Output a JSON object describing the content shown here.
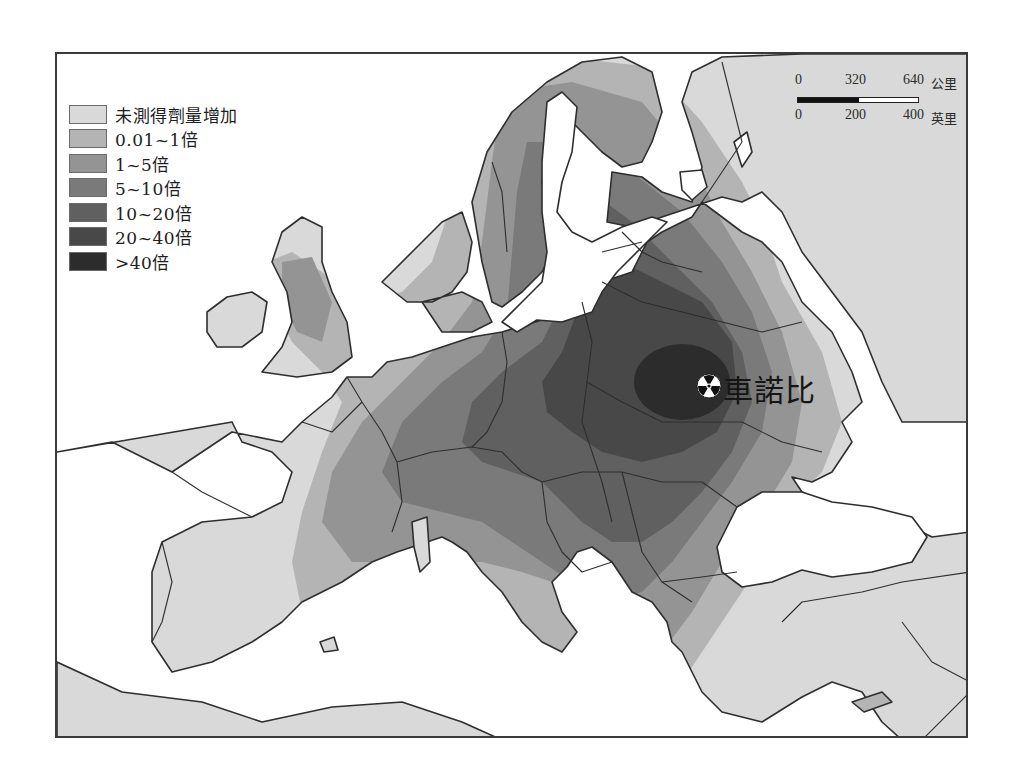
{
  "map": {
    "title_region": "Europe",
    "legend": {
      "items": [
        {
          "label": "未測得劑量增加",
          "color": "#d9d9d9"
        },
        {
          "label": "0.01~1倍",
          "color": "#b4b4b4"
        },
        {
          "label": "1~5倍",
          "color": "#949494"
        },
        {
          "label": "5~10倍",
          "color": "#7a7a7a"
        },
        {
          "label": "10~20倍",
          "color": "#606060"
        },
        {
          "label": "20~40倍",
          "color": "#484848"
        },
        {
          "label": ">40倍",
          "color": "#2c2c2c"
        }
      ]
    },
    "scale": {
      "km_ticks": [
        "0",
        "320",
        "640"
      ],
      "km_unit": "公里",
      "mi_ticks": [
        "0",
        "200",
        "400"
      ],
      "mi_unit": "英里"
    },
    "marker": {
      "label": "車諾比",
      "icon": "radiation-icon"
    },
    "colors": {
      "sea": "#ffffff",
      "border": "#2e2e2e",
      "no_increase": "#d9d9d9"
    }
  }
}
